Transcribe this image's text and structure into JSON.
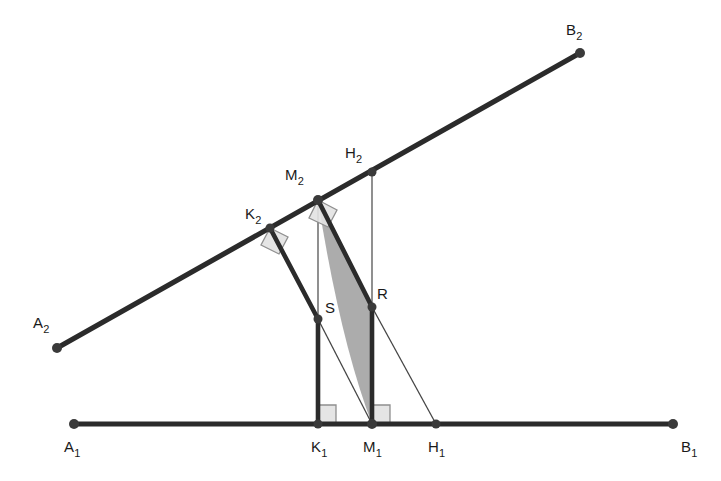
{
  "figure": {
    "background_color": "#ffffff",
    "stroke_colors": {
      "thick_line": "#2b2b2b",
      "thin_line": "#454545",
      "point_fill": "#3a3a3a",
      "right_angle_stroke": "#8f8f8f",
      "right_angle_fill": "#e2e2e2",
      "shaded_region_fill": "#a8a8a8"
    },
    "labels": [
      {
        "name": "A2",
        "base": "A",
        "sub": "2",
        "x": 33,
        "y": 328
      },
      {
        "name": "B2",
        "base": "B",
        "sub": "2",
        "x": 566,
        "y": 35
      },
      {
        "name": "K2",
        "base": "K",
        "sub": "2",
        "x": 245,
        "y": 219
      },
      {
        "name": "M2",
        "base": "M",
        "sub": "2",
        "x": 285,
        "y": 180
      },
      {
        "name": "H2",
        "base": "H",
        "sub": "2",
        "x": 345,
        "y": 158
      },
      {
        "name": "S",
        "base": "S",
        "sub": "",
        "x": 325,
        "y": 313
      },
      {
        "name": "R",
        "base": "R",
        "sub": "",
        "x": 377,
        "y": 299
      },
      {
        "name": "A1",
        "base": "A",
        "sub": "1",
        "x": 64,
        "y": 452
      },
      {
        "name": "K1",
        "base": "K",
        "sub": "1",
        "x": 311,
        "y": 452
      },
      {
        "name": "M1",
        "base": "M",
        "sub": "1",
        "x": 363,
        "y": 452
      },
      {
        "name": "H1",
        "base": "H",
        "sub": "1",
        "x": 428,
        "y": 452
      },
      {
        "name": "B1",
        "base": "B",
        "sub": "1",
        "x": 681,
        "y": 452
      }
    ],
    "points": [
      {
        "name": "A2",
        "x": 57,
        "y": 348,
        "radius": 5
      },
      {
        "name": "K2",
        "x": 270,
        "y": 228,
        "radius": 4.5
      },
      {
        "name": "M2",
        "x": 318,
        "y": 200,
        "radius": 5
      },
      {
        "name": "H2",
        "x": 372,
        "y": 172,
        "radius": 4.5
      },
      {
        "name": "B2",
        "x": 580,
        "y": 53,
        "radius": 5
      },
      {
        "name": "S",
        "x": 318,
        "y": 319,
        "radius": 4.5
      },
      {
        "name": "R",
        "x": 372,
        "y": 307,
        "radius": 4.5
      },
      {
        "name": "A1",
        "x": 74,
        "y": 424,
        "radius": 5
      },
      {
        "name": "K1",
        "x": 318,
        "y": 424,
        "radius": 4.5
      },
      {
        "name": "M1",
        "x": 372,
        "y": 424,
        "radius": 5
      },
      {
        "name": "H1",
        "x": 436,
        "y": 424,
        "radius": 4.5
      },
      {
        "name": "B1",
        "x": 673,
        "y": 424,
        "radius": 5
      }
    ],
    "segments": [
      {
        "name": "ray-A2-B2",
        "x1": 57,
        "y1": 348,
        "x2": 580,
        "y2": 53,
        "width": 5.2,
        "kind": "thick"
      },
      {
        "name": "ray-A1-B1",
        "x1": 74,
        "y1": 424,
        "x2": 673,
        "y2": 424,
        "width": 5.2,
        "kind": "thick"
      },
      {
        "name": "segment-K2-S",
        "x1": 270,
        "y1": 228,
        "x2": 318,
        "y2": 319,
        "width": 4.6,
        "kind": "thick"
      },
      {
        "name": "segment-S-K1",
        "x1": 318,
        "y1": 319,
        "x2": 318,
        "y2": 424,
        "width": 4.6,
        "kind": "thick"
      },
      {
        "name": "segment-M2-R",
        "x1": 318,
        "y1": 200,
        "x2": 372,
        "y2": 307,
        "width": 4.6,
        "kind": "thick"
      },
      {
        "name": "segment-R-M1",
        "x1": 372,
        "y1": 307,
        "x2": 372,
        "y2": 424,
        "width": 4.6,
        "kind": "thick"
      },
      {
        "name": "segment-M2-K1",
        "x1": 318,
        "y1": 200,
        "x2": 318,
        "y2": 424,
        "width": 1.2,
        "kind": "thin"
      },
      {
        "name": "segment-H2-M1",
        "x1": 372,
        "y1": 172,
        "x2": 372,
        "y2": 424,
        "width": 1.2,
        "kind": "thin"
      },
      {
        "name": "segment-S-M1",
        "x1": 318,
        "y1": 319,
        "x2": 372,
        "y2": 424,
        "width": 1.3,
        "kind": "thin"
      },
      {
        "name": "segment-R-H1",
        "x1": 372,
        "y1": 307,
        "x2": 436,
        "y2": 424,
        "width": 1.3,
        "kind": "thin"
      }
    ],
    "right_angle_marks": [
      {
        "name": "right-angle-at-K2",
        "points": "270,228 288,237 279,254 261,245",
        "size": 18
      },
      {
        "name": "right-angle-at-M2",
        "points": "318,200 337,210 328,227 309,218",
        "size": 19
      },
      {
        "name": "right-angle-at-K1",
        "points": "318,424 318,405 336,405 336,424",
        "size": 19
      },
      {
        "name": "right-angle-at-M1",
        "points": "372,424 372,405 390,405 390,424",
        "size": 19
      }
    ],
    "shaded_region": {
      "name": "lens-shaded-region",
      "description": "Curved sliver bounded right by M2-R-M1 polyline and left by an arc bulging leftward from M2 to M1",
      "path": "M 318 200 L 372 307 L 372 424 Q 340 340 318 200 Z",
      "fill": "#a8a8a8",
      "opacity": 0.95
    }
  }
}
